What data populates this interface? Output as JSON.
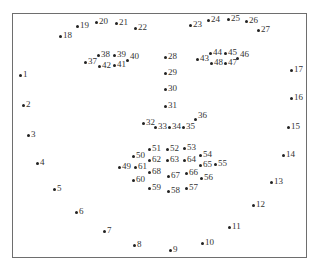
{
  "diagram": {
    "title": "",
    "type": "facial-landmarks-68",
    "frame": {
      "border_color": "#6e6e6e",
      "background": "#ffffff"
    },
    "dot_color": "#222222",
    "label_color": "#333333",
    "points": [
      {
        "id": "1",
        "label": "1",
        "x": 20,
        "y": 75
      },
      {
        "id": "2",
        "label": "2",
        "x": 23,
        "y": 105
      },
      {
        "id": "3",
        "label": "3",
        "x": 28,
        "y": 135
      },
      {
        "id": "4",
        "label": "4",
        "x": 37,
        "y": 163
      },
      {
        "id": "5",
        "label": "5",
        "x": 54,
        "y": 189
      },
      {
        "id": "6",
        "label": "6",
        "x": 76,
        "y": 212
      },
      {
        "id": "7",
        "label": "7",
        "x": 104,
        "y": 231
      },
      {
        "id": "8",
        "label": "8",
        "x": 134,
        "y": 245
      },
      {
        "id": "9",
        "label": "9",
        "x": 170,
        "y": 250
      },
      {
        "id": "10",
        "label": "10",
        "x": 202,
        "y": 243
      },
      {
        "id": "11",
        "label": "11",
        "x": 229,
        "y": 227
      },
      {
        "id": "12",
        "label": "12",
        "x": 253,
        "y": 205
      },
      {
        "id": "13",
        "label": "13",
        "x": 271,
        "y": 182
      },
      {
        "id": "14",
        "label": "14",
        "x": 283,
        "y": 155
      },
      {
        "id": "15",
        "label": "15",
        "x": 288,
        "y": 127
      },
      {
        "id": "16",
        "label": "16",
        "x": 291,
        "y": 98
      },
      {
        "id": "17",
        "label": "17",
        "x": 291,
        "y": 70
      },
      {
        "id": "18",
        "label": "18",
        "x": 60,
        "y": 36
      },
      {
        "id": "19",
        "label": "19",
        "x": 77,
        "y": 26
      },
      {
        "id": "20",
        "label": "20",
        "x": 96,
        "y": 22
      },
      {
        "id": "21",
        "label": "21",
        "x": 116,
        "y": 23
      },
      {
        "id": "22",
        "label": "22",
        "x": 135,
        "y": 28
      },
      {
        "id": "23",
        "label": "23",
        "x": 190,
        "y": 25
      },
      {
        "id": "24",
        "label": "24",
        "x": 208,
        "y": 20
      },
      {
        "id": "25",
        "label": "25",
        "x": 228,
        "y": 19
      },
      {
        "id": "26",
        "label": "26",
        "x": 246,
        "y": 21
      },
      {
        "id": "27",
        "label": "27",
        "x": 258,
        "y": 30
      },
      {
        "id": "28",
        "label": "28",
        "x": 165,
        "y": 57
      },
      {
        "id": "29",
        "label": "29",
        "x": 165,
        "y": 73
      },
      {
        "id": "30",
        "label": "30",
        "x": 165,
        "y": 89
      },
      {
        "id": "31",
        "label": "31",
        "x": 165,
        "y": 106
      },
      {
        "id": "32",
        "label": "32",
        "x": 143,
        "y": 123
      },
      {
        "id": "33",
        "label": "33",
        "x": 155,
        "y": 127
      },
      {
        "id": "34",
        "label": "34",
        "x": 169,
        "y": 127
      },
      {
        "id": "35",
        "label": "35",
        "x": 183,
        "y": 127
      },
      {
        "id": "36",
        "label": "36",
        "x": 195,
        "y": 119,
        "superscript": true
      },
      {
        "id": "37",
        "label": "37",
        "x": 85,
        "y": 62
      },
      {
        "id": "38",
        "label": "38",
        "x": 98,
        "y": 55
      },
      {
        "id": "39",
        "label": "39",
        "x": 114,
        "y": 55
      },
      {
        "id": "40",
        "label": "40",
        "x": 127,
        "y": 60,
        "superscript": true
      },
      {
        "id": "41",
        "label": "41",
        "x": 114,
        "y": 65
      },
      {
        "id": "42",
        "label": "42",
        "x": 99,
        "y": 66
      },
      {
        "id": "43",
        "label": "43",
        "x": 197,
        "y": 59
      },
      {
        "id": "44",
        "label": "44",
        "x": 210,
        "y": 53
      },
      {
        "id": "45",
        "label": "45",
        "x": 225,
        "y": 53
      },
      {
        "id": "46",
        "label": "46",
        "x": 237,
        "y": 58,
        "superscript": true
      },
      {
        "id": "47",
        "label": "47",
        "x": 225,
        "y": 63
      },
      {
        "id": "48",
        "label": "48",
        "x": 211,
        "y": 63
      },
      {
        "id": "49",
        "label": "49",
        "x": 119,
        "y": 167
      },
      {
        "id": "50",
        "label": "50",
        "x": 133,
        "y": 156
      },
      {
        "id": "51",
        "label": "51",
        "x": 149,
        "y": 149
      },
      {
        "id": "52",
        "label": "52",
        "x": 167,
        "y": 149
      },
      {
        "id": "53",
        "label": "53",
        "x": 184,
        "y": 148
      },
      {
        "id": "54",
        "label": "54",
        "x": 200,
        "y": 155
      },
      {
        "id": "55",
        "label": "55",
        "x": 215,
        "y": 164
      },
      {
        "id": "56",
        "label": "56",
        "x": 201,
        "y": 178
      },
      {
        "id": "57",
        "label": "57",
        "x": 186,
        "y": 188
      },
      {
        "id": "58",
        "label": "58",
        "x": 168,
        "y": 191
      },
      {
        "id": "59",
        "label": "59",
        "x": 149,
        "y": 188
      },
      {
        "id": "60",
        "label": "60",
        "x": 133,
        "y": 180
      },
      {
        "id": "61",
        "label": "61",
        "x": 135,
        "y": 167
      },
      {
        "id": "62",
        "label": "62",
        "x": 149,
        "y": 160
      },
      {
        "id": "63",
        "label": "63",
        "x": 167,
        "y": 160
      },
      {
        "id": "64",
        "label": "64",
        "x": 184,
        "y": 160
      },
      {
        "id": "65",
        "label": "65",
        "x": 200,
        "y": 165
      },
      {
        "id": "66",
        "label": "66",
        "x": 186,
        "y": 173
      },
      {
        "id": "67",
        "label": "67",
        "x": 168,
        "y": 176
      },
      {
        "id": "68",
        "label": "68",
        "x": 149,
        "y": 172
      }
    ]
  }
}
